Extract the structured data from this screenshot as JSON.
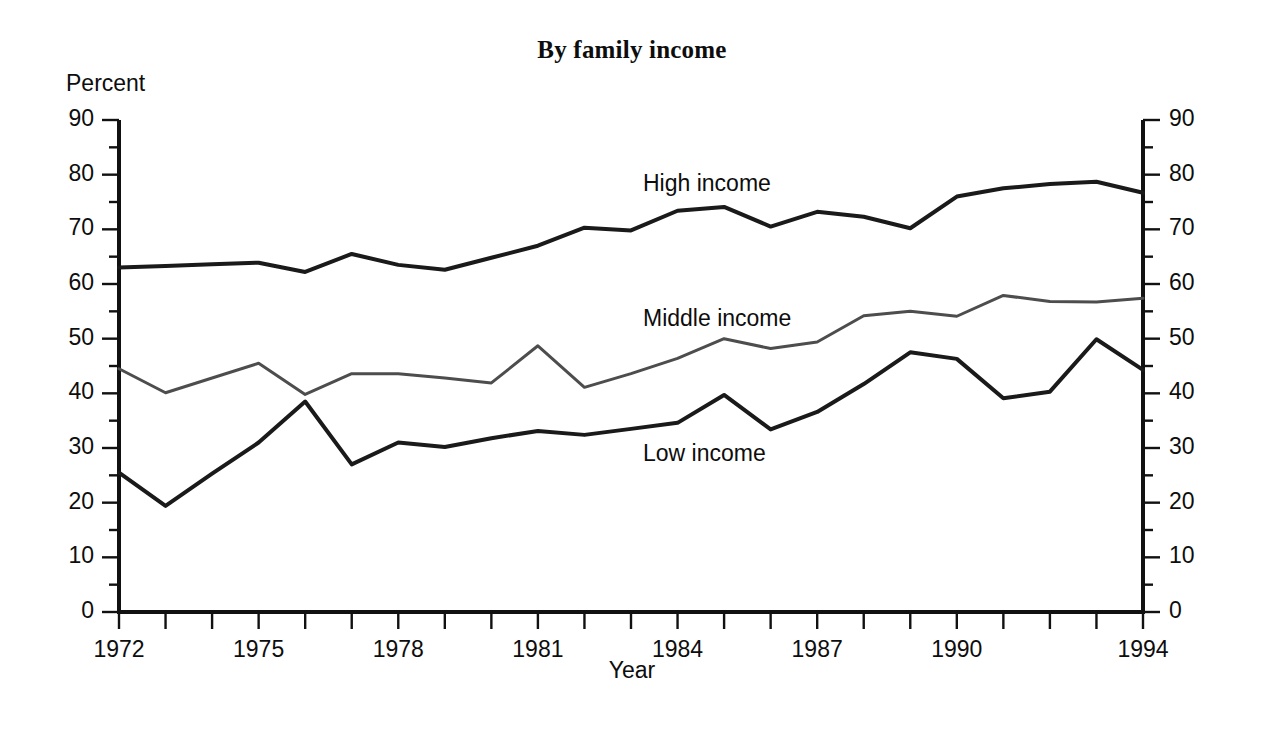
{
  "chart_data": {
    "type": "line",
    "title": "By family income",
    "xlabel": "Year",
    "ylabel": "Percent",
    "xlim": [
      1972,
      1994
    ],
    "ylim": [
      0,
      90
    ],
    "grid": false,
    "legend_position": "inline-annotations",
    "y_ticks": [
      0,
      10,
      20,
      30,
      40,
      50,
      60,
      70,
      80,
      90
    ],
    "y_minor_ticks": [
      5,
      15,
      25,
      35,
      45,
      55,
      65,
      75,
      85
    ],
    "y_tick_labels": [
      "0",
      "10",
      "20",
      "30",
      "40",
      "50",
      "60",
      "70",
      "80",
      "90"
    ],
    "x_ticks": [
      1972,
      1973,
      1974,
      1975,
      1976,
      1977,
      1978,
      1979,
      1980,
      1981,
      1982,
      1983,
      1984,
      1985,
      1986,
      1987,
      1988,
      1989,
      1990,
      1991,
      1992,
      1993,
      1994
    ],
    "x_tick_labels": [
      {
        "year": 1972,
        "label": "1972"
      },
      {
        "year": 1975,
        "label": "1975"
      },
      {
        "year": 1978,
        "label": "1978"
      },
      {
        "year": 1981,
        "label": "1981"
      },
      {
        "year": 1984,
        "label": "1984"
      },
      {
        "year": 1987,
        "label": "1987"
      },
      {
        "year": 1990,
        "label": "1990"
      },
      {
        "year": 1994,
        "label": "1994"
      }
    ],
    "x": [
      1972,
      1973,
      1974,
      1975,
      1976,
      1977,
      1978,
      1979,
      1980,
      1981,
      1982,
      1983,
      1984,
      1985,
      1986,
      1987,
      1988,
      1989,
      1990,
      1991,
      1992,
      1993,
      1994
    ],
    "series": [
      {
        "name": "High income",
        "color": "#1a1a1a",
        "stroke_width": 4.0,
        "values": [
          63.0,
          63.3,
          63.6,
          63.9,
          62.2,
          65.5,
          63.5,
          62.6,
          64.8,
          67.0,
          70.3,
          69.8,
          73.4,
          74.1,
          70.5,
          73.2,
          72.3,
          70.2,
          76.0,
          77.5,
          78.3,
          78.7,
          76.7
        ]
      },
      {
        "name": "Middle income",
        "color": "#4d4d4d",
        "stroke_width": 3.0,
        "values": [
          44.5,
          40.1,
          42.8,
          45.5,
          39.8,
          43.6,
          43.6,
          42.8,
          41.9,
          48.7,
          41.1,
          43.6,
          46.4,
          50.0,
          48.2,
          49.4,
          54.2,
          55.0,
          54.1,
          57.9,
          56.8,
          56.7,
          57.4
        ]
      },
      {
        "name": "Low income",
        "color": "#1a1a1a",
        "stroke_width": 4.0,
        "values": [
          25.5,
          19.4,
          25.3,
          31.0,
          38.5,
          27.0,
          31.0,
          30.2,
          31.8,
          33.1,
          32.4,
          33.5,
          34.6,
          39.7,
          33.4,
          36.6,
          41.7,
          47.5,
          46.3,
          39.1,
          40.3,
          49.9,
          44.3
        ]
      }
    ],
    "annotations": [
      {
        "text": "High income",
        "x_px": 643,
        "y_px": 170
      },
      {
        "text": "Middle income",
        "x_px": 643,
        "y_px": 305
      },
      {
        "text": "Low income",
        "x_px": 643,
        "y_px": 440
      }
    ]
  }
}
